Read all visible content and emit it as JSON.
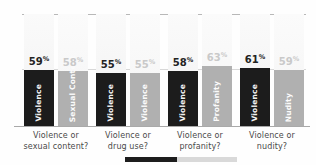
{
  "chart_data": {
    "type": "bar",
    "title": "",
    "subtitle": "",
    "xlabel": "",
    "ylabel": "",
    "ylim": [
      0,
      100
    ],
    "grid": true,
    "legend_position": "none",
    "categories": [
      "Violence or sexual content?",
      "Violence or drug use?",
      "Violence or profanity?",
      "Violence or nudity?"
    ],
    "series": [
      {
        "name": "Violence",
        "values": [
          59,
          55,
          58,
          61
        ]
      },
      {
        "name": "Alternative",
        "values": [
          58,
          55,
          63,
          59
        ]
      }
    ],
    "groups": [
      {
        "caption_line1": "Violence or",
        "caption_line2": "sexual content?",
        "bars": [
          {
            "label": "Violence",
            "value": 59,
            "value_text": "59",
            "pct_symbol": "%",
            "tone": "dark",
            "color": "#1c1c1c"
          },
          {
            "label": "Sexual Content",
            "value": 58,
            "value_text": "58",
            "pct_symbol": "%",
            "tone": "light",
            "color": "#b0b0b0"
          }
        ]
      },
      {
        "caption_line1": "Violence or",
        "caption_line2": "drug use?",
        "bars": [
          {
            "label": "Violence",
            "value": 55,
            "value_text": "55",
            "pct_symbol": "%",
            "tone": "dark",
            "color": "#1c1c1c"
          },
          {
            "label": "Violence",
            "value": 55,
            "value_text": "55",
            "pct_symbol": "%",
            "tone": "light",
            "color": "#b0b0b0"
          }
        ]
      },
      {
        "caption_line1": "Violence or",
        "caption_line2": "profanity?",
        "bars": [
          {
            "label": "Violence",
            "value": 58,
            "value_text": "58",
            "pct_symbol": "%",
            "tone": "dark",
            "color": "#1c1c1c"
          },
          {
            "label": "Profanity",
            "value": 63,
            "value_text": "63",
            "pct_symbol": "%",
            "tone": "light",
            "color": "#b0b0b0"
          }
        ]
      },
      {
        "caption_line1": "Violence or",
        "caption_line2": "nudity?",
        "bars": [
          {
            "label": "Violence",
            "value": 61,
            "value_text": "61",
            "pct_symbol": "%",
            "tone": "dark",
            "color": "#1c1c1c"
          },
          {
            "label": "Nudity",
            "value": 59,
            "value_text": "59",
            "pct_symbol": "%",
            "tone": "light",
            "color": "#b0b0b0"
          }
        ]
      }
    ],
    "colors": {
      "dark_bar": "#1c1c1c",
      "light_bar": "#b0b0b0",
      "gridline": "#d8d8d8",
      "axis": "#a9a9a9",
      "caption_text": "#4a4a4a",
      "dark_value_text": "#232323",
      "light_value_text": "#c9c9c9",
      "background": "#fefefe"
    }
  }
}
